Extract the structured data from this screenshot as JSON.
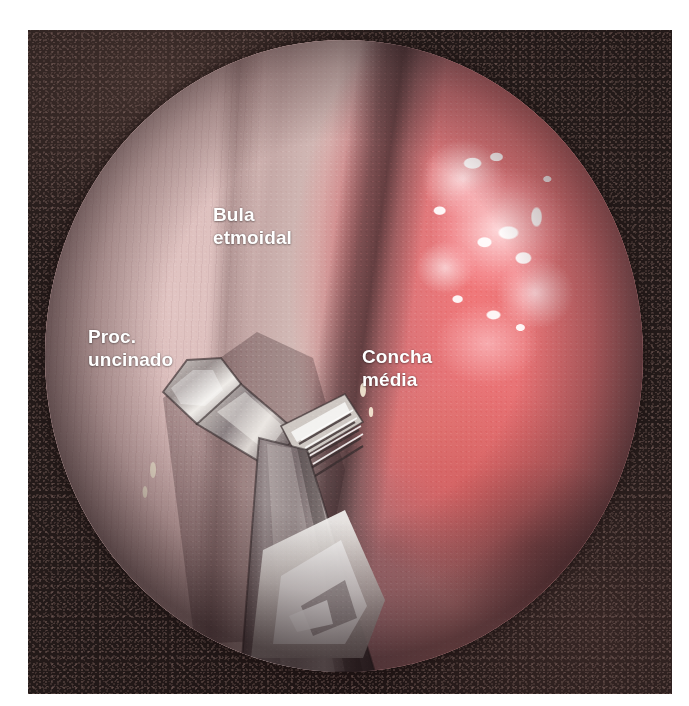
{
  "image": {
    "type": "endoscopic-photograph",
    "modality": "nasal endoscopy",
    "view": "circular endoscope field on dark photographic matte",
    "width": 689,
    "height": 706
  },
  "annotations": [
    {
      "id": "bula-etmoidal",
      "label": "Bula\netmoidal",
      "line1": "Bula",
      "line2": "etmoidal",
      "color": "#ffffff",
      "x": 213,
      "y": 203
    },
    {
      "id": "proc-uncinado",
      "label": "Proc.\nuncinado",
      "line1": "Proc.",
      "line2": "uncinado",
      "color": "#ffffff",
      "x": 88,
      "y": 325
    },
    {
      "id": "concha-media",
      "label": "Concha\nmédia",
      "line1": "Concha",
      "line2": "média",
      "color": "#ffffff",
      "x": 362,
      "y": 345
    }
  ],
  "scope_field": {
    "shape": "circle",
    "center_x": 344,
    "center_y": 356,
    "radius_x": 299,
    "radius_y": 316
  },
  "colors": {
    "matte_background": "#231a19",
    "page_background": "#ffffff",
    "label_text": "#ffffff",
    "pale_mucosa": "#d6b4b2",
    "inflamed_mucosa": "#ef787a",
    "deep_red_fold": "#b05656",
    "instrument_metal": "#b9b4b0",
    "instrument_shadow": "#4a3f41",
    "specular_highlight": "#ffffff"
  },
  "instrument": {
    "name": "endoscopic-forceps",
    "description": "metallic through-cutting forceps with serrated jaw entering from lower field",
    "visible": true
  }
}
